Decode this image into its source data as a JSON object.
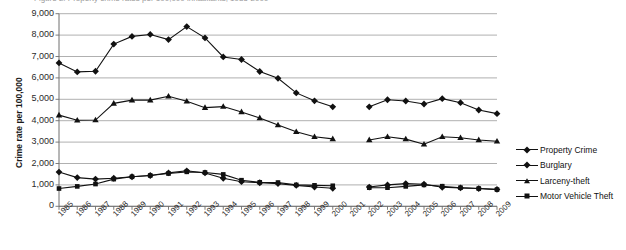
{
  "figure": {
    "clipped_title": "Figure 2. Property crime rates per 100,000 inhabitants, 1985-2009",
    "ylabel": "Crime rate per 100,000"
  },
  "legend": {
    "position": "right",
    "items": [
      {
        "label": "Property Crime",
        "marker": "diamond",
        "color": "#111111"
      },
      {
        "label": "Burglary",
        "marker": "diamond",
        "color": "#111111"
      },
      {
        "label": "Larceny-theft",
        "marker": "triangle",
        "color": "#111111"
      },
      {
        "label": "Motor Vehicle Theft",
        "marker": "square",
        "color": "#111111"
      }
    ]
  },
  "chart_data": {
    "type": "line",
    "title": "",
    "xlabel": "",
    "ylabel": "Crime rate per 100,000",
    "ylim": [
      0,
      9000
    ],
    "ytick_step": 1000,
    "ytick_labels": [
      "9,000",
      "8,000",
      "7,000",
      "6,000",
      "5,000",
      "4,000",
      "3,000",
      "2,000",
      "1,000",
      "0"
    ],
    "grid": "horizontal",
    "categories": [
      "1985",
      "1986",
      "1987",
      "1988",
      "1989",
      "1990",
      "1991",
      "1992",
      "1993",
      "1994",
      "1995",
      "1996",
      "1997",
      "1998",
      "1999",
      "2000",
      "2001",
      "2002",
      "2003",
      "2004",
      "2005",
      "2006",
      "2007",
      "2008",
      "2009"
    ],
    "missing_category": "2001",
    "series": [
      {
        "name": "Property Crime",
        "marker": "diamond",
        "values": [
          6700,
          6280,
          6310,
          7580,
          7940,
          8030,
          7790,
          8400,
          7870,
          6980,
          6860,
          6300,
          5980,
          5300,
          4930,
          4650,
          null,
          4650,
          4980,
          4920,
          4780,
          5030,
          4840,
          4500,
          4330
        ]
      },
      {
        "name": "Burglary",
        "marker": "diamond",
        "values": [
          1600,
          1340,
          1270,
          1310,
          1380,
          1440,
          1560,
          1660,
          1560,
          1310,
          1150,
          1100,
          1060,
          980,
          900,
          840,
          null,
          900,
          1000,
          1060,
          1030,
          890,
          860,
          830,
          790
        ]
      },
      {
        "name": "Larceny-theft",
        "marker": "triangle",
        "values": [
          4260,
          4020,
          4030,
          4810,
          4960,
          4960,
          5140,
          4910,
          4610,
          4660,
          4410,
          4130,
          3800,
          3480,
          3250,
          3150,
          null,
          3100,
          3250,
          3140,
          2900,
          3250,
          3200,
          3100,
          3040
        ]
      },
      {
        "name": "Motor Vehicle Theft",
        "marker": "square",
        "values": [
          830,
          930,
          1040,
          1270,
          1380,
          1440,
          1530,
          1610,
          1580,
          1490,
          1220,
          1120,
          1110,
          1000,
          980,
          960,
          null,
          870,
          870,
          930,
          1000,
          940,
          870,
          830,
          780
        ]
      }
    ]
  }
}
